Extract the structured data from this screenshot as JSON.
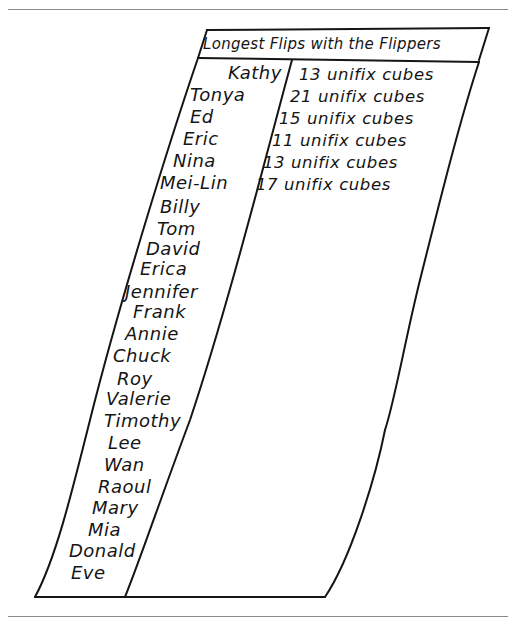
{
  "title": "Longest Flips with the Flippers",
  "rows": [
    {
      "name": "Kathy",
      "value": "13 unifix cubes"
    },
    {
      "name": "Tonya",
      "value": "21 unifix cubes"
    },
    {
      "name": "Ed",
      "value": "15 unifix cubes"
    },
    {
      "name": "Eric",
      "value": "11 unifix cubes"
    },
    {
      "name": "Nina",
      "value": "13 unifix cubes"
    },
    {
      "name": "Mei-Lin",
      "value": "17 unifix cubes"
    },
    {
      "name": "Billy",
      "value": ""
    },
    {
      "name": "Tom",
      "value": ""
    },
    {
      "name": "David",
      "value": ""
    },
    {
      "name": "Erica",
      "value": ""
    },
    {
      "name": "Jennifer",
      "value": ""
    },
    {
      "name": "Frank",
      "value": ""
    },
    {
      "name": "Annie",
      "value": ""
    },
    {
      "name": "Chuck",
      "value": ""
    },
    {
      "name": "Roy",
      "value": ""
    },
    {
      "name": "Valerie",
      "value": ""
    },
    {
      "name": "Timothy",
      "value": ""
    },
    {
      "name": "Lee",
      "value": ""
    },
    {
      "name": "Wan",
      "value": ""
    },
    {
      "name": "Raoul",
      "value": ""
    },
    {
      "name": "Mary",
      "value": ""
    },
    {
      "name": "Mia",
      "value": ""
    },
    {
      "name": "Donald",
      "value": ""
    },
    {
      "name": "Eve",
      "value": ""
    }
  ],
  "colors": {
    "ink": "#151515",
    "rule": "#8a8a8a",
    "background": "#ffffff"
  }
}
